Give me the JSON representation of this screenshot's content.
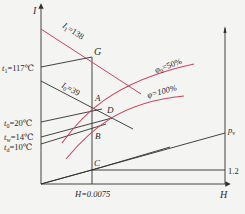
{
  "diagram": {
    "type": "I-H psychrometric chart (enthalpy-humidity diagram)",
    "axes": {
      "y_label": "I",
      "x_label": "H"
    },
    "points": {
      "G": "G",
      "A": "A",
      "D": "D",
      "B": "B",
      "C": "C"
    },
    "lines": {
      "I1": "I",
      "I1_sub": "1",
      "I1_val": "=138",
      "I0": "I",
      "I0_sub": "0",
      "I0_val": "=39",
      "phi0": "φ",
      "phi0_sub": "0",
      "phi0_val": "=50%",
      "phi100": "φ=100%",
      "pv": "p",
      "pv_sub": "v"
    },
    "temperatures": {
      "t1": {
        "sym": "t",
        "sub": "1",
        "val": "=117℃"
      },
      "t0": {
        "sym": "t",
        "sub": "0",
        "val": "=20℃"
      },
      "tw": {
        "sym": "t",
        "sub": "w",
        "val": "=14℃"
      },
      "td": {
        "sym": "t",
        "sub": "d",
        "val": "=10℃"
      }
    },
    "annotations": {
      "h_value": "H=0.0075",
      "right_scale": "1.2"
    },
    "colors": {
      "line_dark": "#2f2f2f",
      "curve_red": "#d2425c",
      "background": "#f4f4f2"
    }
  }
}
